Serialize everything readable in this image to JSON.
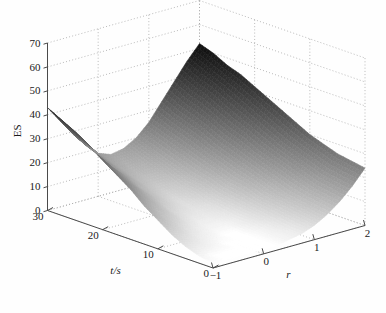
{
  "chart_data": {
    "type": "surface",
    "title": "",
    "xlabel": "r",
    "ylabel": "t/s",
    "zlabel": "ES",
    "xlim": [
      -1,
      2
    ],
    "ylim": [
      0,
      30
    ],
    "zlim": [
      0,
      70
    ],
    "xticks": [
      -1,
      0,
      1,
      2
    ],
    "xtick_labels": [
      "−1",
      "0",
      "1",
      "2"
    ],
    "yticks": [
      30,
      20,
      10,
      0
    ],
    "ytick_labels": [
      "30",
      "20",
      "10",
      "0"
    ],
    "zticks": [
      0,
      10,
      20,
      30,
      40,
      50,
      60,
      70
    ],
    "ztick_labels": [
      "0",
      "10",
      "20",
      "30",
      "40",
      "50",
      "60",
      "70"
    ],
    "grid": true,
    "legend": false,
    "colormap": "grayscale",
    "colormap_dark_hex": "#101010",
    "colormap_light_hex": "#ffffff",
    "view_azimuth_deg": -37,
    "view_elevation_deg": 22,
    "surface_description": "Valley-shaped ES surface over r and t; high dark ridge at r=-1 side, bright white minimum valley running diagonally, steep rise to ES~50 at r=2, t=30 corner",
    "z_min_observed": 2,
    "z_max_observed": 52,
    "r_grid": [
      -1,
      -0.75,
      -0.5,
      -0.25,
      0,
      0.25,
      0.5,
      0.75,
      1,
      1.25,
      1.5,
      1.75,
      2
    ],
    "t_grid": [
      0,
      2.5,
      5,
      7.5,
      10,
      12.5,
      15,
      17.5,
      20,
      22.5,
      25,
      27.5,
      30
    ],
    "z_values": [
      [
        2,
        2,
        2,
        2,
        2,
        2,
        3,
        4,
        6,
        9,
        13,
        18,
        24
      ],
      [
        3,
        2,
        2,
        2,
        2,
        2,
        3,
        4,
        7,
        10,
        14,
        19,
        25
      ],
      [
        5,
        4,
        3,
        2,
        2,
        2,
        3,
        5,
        8,
        11,
        15,
        20,
        26
      ],
      [
        8,
        6,
        4,
        3,
        2,
        2,
        4,
        6,
        9,
        12,
        17,
        22,
        28
      ],
      [
        12,
        9,
        6,
        4,
        3,
        3,
        4,
        7,
        10,
        14,
        19,
        24,
        30
      ],
      [
        16,
        12,
        9,
        6,
        4,
        4,
        5,
        8,
        12,
        16,
        21,
        26,
        33
      ],
      [
        21,
        16,
        12,
        8,
        6,
        5,
        6,
        9,
        13,
        18,
        23,
        29,
        36
      ],
      [
        25,
        20,
        15,
        11,
        8,
        6,
        8,
        11,
        15,
        20,
        26,
        32,
        39
      ],
      [
        29,
        23,
        18,
        13,
        10,
        8,
        9,
        12,
        17,
        22,
        28,
        35,
        42
      ],
      [
        33,
        27,
        21,
        16,
        12,
        10,
        11,
        14,
        19,
        25,
        31,
        38,
        45
      ],
      [
        37,
        30,
        24,
        18,
        14,
        12,
        13,
        16,
        21,
        27,
        34,
        41,
        47
      ],
      [
        40,
        33,
        26,
        21,
        16,
        14,
        15,
        18,
        23,
        29,
        36,
        43,
        50
      ],
      [
        43,
        36,
        29,
        23,
        18,
        16,
        17,
        20,
        25,
        32,
        39,
        46,
        52
      ]
    ]
  },
  "axes": {
    "z_axis_name": "ES",
    "y_axis_name": "t/s",
    "x_axis_name": "r"
  }
}
